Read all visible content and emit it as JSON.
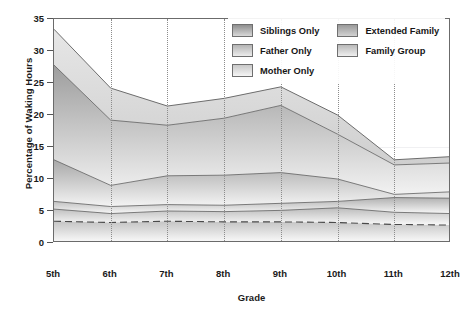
{
  "chart_data": {
    "type": "area",
    "stacked": true,
    "title": "",
    "xlabel": "Grade",
    "ylabel": "Percentage of Waking Hours",
    "categories": [
      "5th",
      "6th",
      "7th",
      "8th",
      "9th",
      "10th",
      "11th",
      "12th"
    ],
    "ylim": [
      0,
      35
    ],
    "yticks": [
      0,
      5,
      10,
      15,
      20,
      25,
      30,
      35
    ],
    "grid": "vertical-dotted",
    "legend_position": "top-right-inside",
    "series": [
      {
        "name": "Family Group",
        "values": [
          3.4,
          3.2,
          3.4,
          3.3,
          3.3,
          3.2,
          2.9,
          2.8
        ]
      },
      {
        "name": "Mother Only",
        "values": [
          1.9,
          1.4,
          1.6,
          1.6,
          1.8,
          2.3,
          1.9,
          1.8
        ]
      },
      {
        "name": "Father Only",
        "values": [
          1.2,
          1.1,
          1.0,
          1.0,
          1.1,
          1.0,
          2.3,
          2.4
        ]
      },
      {
        "name": "Extended Family",
        "values": [
          6.5,
          3.3,
          4.5,
          4.7,
          4.8,
          3.5,
          0.5,
          1.0
        ]
      },
      {
        "name": "Siblings Only",
        "values": [
          14.8,
          10.2,
          7.9,
          8.9,
          10.5,
          7.0,
          4.6,
          4.5
        ]
      }
    ],
    "cumulative_tops": {
      "family_group": [
        3.4,
        3.2,
        3.4,
        3.3,
        3.3,
        3.2,
        2.9,
        2.8
      ],
      "mother_only": [
        5.3,
        4.6,
        5.0,
        4.9,
        5.1,
        5.5,
        4.8,
        4.6
      ],
      "father_only": [
        6.5,
        5.7,
        6.0,
        5.9,
        6.2,
        6.5,
        7.1,
        7.0
      ],
      "extended_family": [
        13.0,
        9.0,
        10.5,
        10.6,
        11.0,
        10.0,
        7.6,
        8.0
      ],
      "siblings_only": [
        27.8,
        19.2,
        18.4,
        19.5,
        21.5,
        17.0,
        12.2,
        12.5
      ]
    },
    "outer_band_top": [
      33.4,
      24.2,
      21.4,
      22.6,
      24.4,
      20.0,
      13.0,
      13.5
    ]
  },
  "axes": {
    "y_title": "Percentage of Waking Hours",
    "x_title": "Grade",
    "y_ticks": [
      "0",
      "5",
      "10",
      "15",
      "20",
      "25",
      "30",
      "35"
    ],
    "x_ticks": [
      "5th",
      "6th",
      "7th",
      "8th",
      "9th",
      "10th",
      "11th",
      "12th"
    ]
  },
  "legend": {
    "items": [
      {
        "label": "Siblings Only",
        "swatch_top": "#8f8f8f",
        "swatch_bottom": "#d8d8d8"
      },
      {
        "label": "Extended Family",
        "swatch_top": "#9a9a9a",
        "swatch_bottom": "#d2d2d2"
      },
      {
        "label": "Father Only",
        "swatch_top": "#b4b4b4",
        "swatch_bottom": "#ececec"
      },
      {
        "label": "Family Group",
        "swatch_top": "#b9b9b9",
        "swatch_bottom": "#efefef"
      },
      {
        "label": "Mother Only",
        "swatch_top": "#c8c8c8",
        "swatch_bottom": "#f5f5f5"
      }
    ]
  },
  "colors": {
    "frame": "#6b6b6b",
    "gridline": "#8c8c8c",
    "text": "#1a1a1a",
    "band_outline": "#5f5f5f"
  }
}
